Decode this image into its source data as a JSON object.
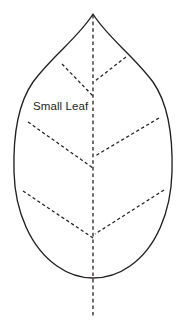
{
  "figure": {
    "background_color": "#ffffff",
    "stroke_color": "#231f20",
    "label": {
      "text": "Small Leaf",
      "x": 33,
      "y": 110,
      "font_size": 11.5,
      "color": "#231f20"
    }
  },
  "leaf": {
    "name": "leaf-shape",
    "apex": {
      "x": 93,
      "y": 14
    },
    "base": {
      "x": 93,
      "y": 277
    },
    "widest_left_x": 14,
    "widest_right_x": 172,
    "widest_y": 180,
    "outline_style": "solid",
    "fill": "#ffffff"
  },
  "midrib": {
    "name": "midrib-vein",
    "style": "dashed",
    "from": {
      "x": 93,
      "y": 15
    },
    "to": {
      "x": 93,
      "y": 316
    },
    "extends_below_base": true
  },
  "veins": [
    {
      "name": "vein-upper-left",
      "side": "left",
      "style": "dashed",
      "from": {
        "x": 62,
        "y": 64
      },
      "to": {
        "x": 93,
        "y": 96
      }
    },
    {
      "name": "vein-upper-right",
      "side": "right",
      "style": "dashed",
      "from": {
        "x": 126,
        "y": 57
      },
      "to": {
        "x": 95,
        "y": 81
      }
    },
    {
      "name": "vein-middle-left",
      "side": "left",
      "style": "dashed",
      "from": {
        "x": 28,
        "y": 122
      },
      "to": {
        "x": 93,
        "y": 168
      }
    },
    {
      "name": "vein-middle-right",
      "side": "right",
      "style": "dashed",
      "from": {
        "x": 159,
        "y": 118
      },
      "to": {
        "x": 95,
        "y": 156
      }
    },
    {
      "name": "vein-lower-left",
      "side": "left",
      "style": "dashed",
      "from": {
        "x": 23,
        "y": 191
      },
      "to": {
        "x": 93,
        "y": 238
      }
    },
    {
      "name": "vein-lower-right",
      "side": "right",
      "style": "dashed",
      "from": {
        "x": 164,
        "y": 190
      },
      "to": {
        "x": 95,
        "y": 234
      }
    }
  ],
  "paths": {
    "outline": "M 93 14 C 79 37, 52 56, 33 82 C 19 102, 13 135, 14 172 C 15 212, 31 248, 57 266 C 71 276, 84 278, 93 278 C 102 278, 116 276, 130 266 C 156 248, 171 212, 172 172 C 173 135, 167 102, 153 82 C 134 56, 107 37, 93 14 Z"
  }
}
